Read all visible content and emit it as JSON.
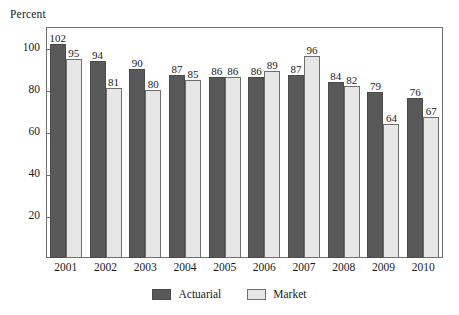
{
  "chart_data": {
    "type": "bar",
    "title": "",
    "subtitle": "",
    "xlabel": "",
    "ylabel": "Percent",
    "ylim": [
      0,
      110
    ],
    "yticks": [
      20,
      40,
      60,
      80,
      100
    ],
    "grid": false,
    "legend_position": "bottom-center",
    "categories": [
      "2001",
      "2002",
      "2003",
      "2004",
      "2005",
      "2006",
      "2007",
      "2008",
      "2009",
      "2010"
    ],
    "series": [
      {
        "name": "Actuarial",
        "color": "#595959",
        "values": [
          102,
          94,
          90,
          87,
          86,
          86,
          87,
          84,
          79,
          76
        ]
      },
      {
        "name": "Market",
        "color": "#e6e6e6",
        "values": [
          95,
          81,
          80,
          85,
          86,
          89,
          96,
          82,
          64,
          67
        ]
      }
    ]
  },
  "colors": {
    "actuarial": "#595959",
    "market": "#e6e6e6",
    "frame": "#6f6f6f",
    "text": "#1a1a1a",
    "background": "#ffffff"
  }
}
